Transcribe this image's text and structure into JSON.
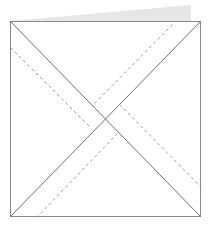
{
  "diagram": {
    "colors": {
      "background": "#ffffff",
      "outline": "#8a8a8a",
      "diagonal": "#6e6e6e",
      "dashed": "#9a9a9a",
      "flap": "#e6e6e6"
    },
    "square": {
      "x": 10,
      "y": 21,
      "width": 190,
      "height": 195
    },
    "flap": {
      "points": "10,21 191,5 191,21"
    },
    "diagonals": [
      {
        "x1": 10,
        "y1": 21,
        "x2": 200,
        "y2": 216
      },
      {
        "x1": 200,
        "y1": 21,
        "x2": 10,
        "y2": 216
      }
    ],
    "dashed_lines": [
      {
        "x1": 10,
        "y1": 47,
        "x2": 91,
        "y2": 128
      },
      {
        "x1": 172,
        "y1": 24,
        "x2": 93,
        "y2": 104
      },
      {
        "x1": 117,
        "y1": 133,
        "x2": 37,
        "y2": 216
      },
      {
        "x1": 119,
        "y1": 104,
        "x2": 200,
        "y2": 186
      }
    ]
  }
}
